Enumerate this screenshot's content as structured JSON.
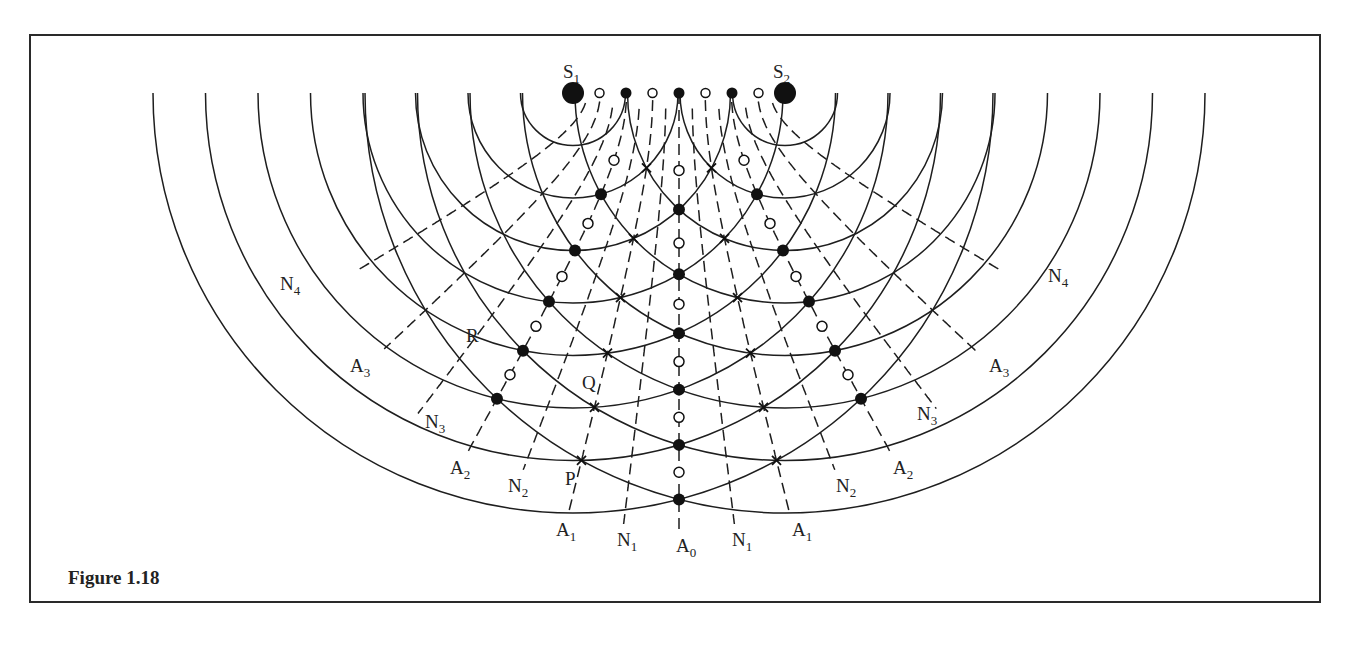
{
  "figure": {
    "caption": "Figure 1.18"
  },
  "sources": [
    {
      "name": "S",
      "sub": "1",
      "x": 573,
      "y": 93,
      "label_x": 563,
      "label_y": 78
    },
    {
      "name": "S",
      "sub": "2",
      "x": 785,
      "y": 93,
      "label_x": 773,
      "label_y": 78
    }
  ],
  "geometry": {
    "wavelength": 52.5,
    "num_wavefronts": 8,
    "top_y": 93
  },
  "lines": [
    {
      "type": "A",
      "sub": "0",
      "k": 0,
      "side": 0,
      "end_y": 530,
      "label_x": 676,
      "label_y": 552
    },
    {
      "type": "N",
      "sub": "1",
      "k": 1,
      "side": -1,
      "end_y": 525,
      "label_x": 617,
      "label_y": 546
    },
    {
      "type": "N",
      "sub": "1",
      "k": 1,
      "side": 1,
      "end_y": 525,
      "label_x": 732,
      "label_y": 546
    },
    {
      "type": "A",
      "sub": "1",
      "k": 2,
      "side": -1,
      "end_y": 515,
      "label_x": 556,
      "label_y": 536
    },
    {
      "type": "A",
      "sub": "1",
      "k": 2,
      "side": 1,
      "end_y": 515,
      "label_x": 792,
      "label_y": 536
    },
    {
      "type": "N",
      "sub": "2",
      "k": 3,
      "side": -1,
      "end_y": 470,
      "label_x": 508,
      "label_y": 492
    },
    {
      "type": "N",
      "sub": "2",
      "k": 3,
      "side": 1,
      "end_y": 470,
      "label_x": 836,
      "label_y": 492
    },
    {
      "type": "A",
      "sub": "2",
      "k": 4,
      "side": -1,
      "end_y": 455,
      "label_x": 450,
      "label_y": 474
    },
    {
      "type": "A",
      "sub": "2",
      "k": 4,
      "side": 1,
      "end_y": 455,
      "label_x": 893,
      "label_y": 474
    },
    {
      "type": "N",
      "sub": "3",
      "k": 5,
      "side": -1,
      "end_y": 415,
      "label_x": 425,
      "label_y": 428
    },
    {
      "type": "N",
      "sub": "3",
      "k": 5,
      "side": 1,
      "end_y": 410,
      "label_x": 917,
      "label_y": 420
    },
    {
      "type": "A",
      "sub": "3",
      "k": 6,
      "side": -1,
      "end_y": 350,
      "label_x": 350,
      "label_y": 372
    },
    {
      "type": "A",
      "sub": "3",
      "k": 6,
      "side": 1,
      "end_y": 355,
      "label_x": 989,
      "label_y": 372
    },
    {
      "type": "N",
      "sub": "4",
      "k": 7,
      "side": -1,
      "end_y": 272,
      "label_x": 280,
      "label_y": 290
    },
    {
      "type": "N",
      "sub": "4",
      "k": 7,
      "side": 1,
      "end_y": 270,
      "label_x": 1048,
      "label_y": 282
    }
  ],
  "points": [
    {
      "name": "P",
      "x": 565,
      "y": 485
    },
    {
      "name": "Q",
      "x": 582,
      "y": 389
    },
    {
      "name": "R",
      "x": 466,
      "y": 342
    }
  ],
  "legend_markers": {
    "crest_crest": "filled-dot",
    "trough_trough": "open-circle",
    "crest_trough": "cross"
  }
}
